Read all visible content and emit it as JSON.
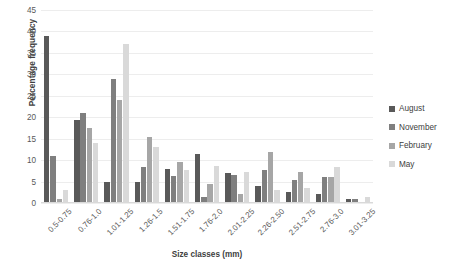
{
  "chart_data": {
    "type": "bar",
    "title": "",
    "xlabel": "Size classes (mm)",
    "ylabel": "Percentage frequency",
    "ylim": [
      0,
      45
    ],
    "yticks": [
      0,
      5,
      10,
      15,
      20,
      25,
      30,
      35,
      40,
      45
    ],
    "grid": true,
    "legend_position": "right",
    "categories": [
      "0.5-0.75",
      "0.76-1.0",
      "1.01-1.25",
      "1.26-1.5",
      "1.51-1.75",
      "1.76-2.0",
      "2.01-2.25",
      "2.26-2.50",
      "2.51-2.75",
      "2.76-3.0",
      "3.01-3.25"
    ],
    "series": [
      {
        "name": "August",
        "color": "#595959",
        "values": [
          39.0,
          19.3,
          5.0,
          5.0,
          8.0,
          11.5,
          7.0,
          4.0,
          2.5,
          2.0,
          1.0
        ]
      },
      {
        "name": "November",
        "color": "#7f7f7f",
        "values": [
          11.0,
          21.0,
          29.0,
          8.3,
          6.3,
          1.5,
          6.5,
          7.8,
          5.3,
          6.0,
          1.0
        ]
      },
      {
        "name": "February",
        "color": "#a6a6a6",
        "values": [
          1.0,
          17.5,
          24.0,
          15.3,
          9.5,
          4.5,
          2.0,
          11.8,
          7.3,
          6.0,
          0.0
        ]
      },
      {
        "name": "May",
        "color": "#d9d9d9",
        "values": [
          3.0,
          14.0,
          37.0,
          13.0,
          7.8,
          8.7,
          7.3,
          3.0,
          3.5,
          8.5,
          1.3
        ]
      }
    ]
  }
}
